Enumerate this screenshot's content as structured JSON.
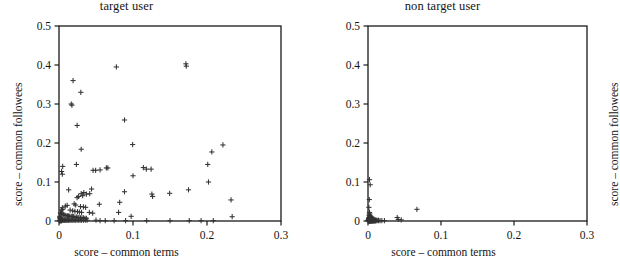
{
  "figure": {
    "background": "#ffffff",
    "marker_color": "#333333",
    "axis_color": "#1a1a1a"
  },
  "panels": [
    {
      "id": "target-user",
      "title": "target user",
      "xlabel": "score – common terms",
      "ylabel": "score – common followees"
    },
    {
      "id": "non-target-user",
      "title": "non target user",
      "xlabel": "score – common terms",
      "ylabel": "score – common followees"
    }
  ],
  "chart_data": [
    {
      "type": "scatter",
      "title": "target user",
      "xlabel": "score – common terms",
      "ylabel": "score – common followees",
      "xlim": [
        0,
        0.3
      ],
      "ylim": [
        0,
        0.5
      ],
      "xticks": [
        0,
        0.1,
        0.2,
        0.3
      ],
      "xtick_labels": [
        "0",
        "0.1",
        "0.2",
        "0.3"
      ],
      "yticks": [
        0,
        0.1,
        0.2,
        0.3,
        0.4,
        0.5
      ],
      "ytick_labels": [
        "0",
        "0.1",
        "0.2",
        "0.3",
        "0.4",
        "0.5"
      ],
      "grid": false,
      "legend": null,
      "marker": "plus",
      "points": [
        [
          0.0775,
          0.395
        ],
        [
          0.1715,
          0.403
        ],
        [
          0.172,
          0.397
        ],
        [
          0.019,
          0.36
        ],
        [
          0.0295,
          0.33
        ],
        [
          0.0165,
          0.3
        ],
        [
          0.0175,
          0.297
        ],
        [
          0.0245,
          0.245
        ],
        [
          0.0885,
          0.259
        ],
        [
          0.0995,
          0.196
        ],
        [
          0.03,
          0.184
        ],
        [
          0.2215,
          0.195
        ],
        [
          0.2065,
          0.177
        ],
        [
          0.201,
          0.145
        ],
        [
          0.0235,
          0.145
        ],
        [
          0.005,
          0.14
        ],
        [
          0.0035,
          0.127
        ],
        [
          0.0045,
          0.12
        ],
        [
          0.046,
          0.13
        ],
        [
          0.0495,
          0.13
        ],
        [
          0.0555,
          0.131
        ],
        [
          0.064,
          0.136
        ],
        [
          0.066,
          0.136
        ],
        [
          0.114,
          0.137
        ],
        [
          0.118,
          0.133
        ],
        [
          0.1245,
          0.133
        ],
        [
          0.1,
          0.116
        ],
        [
          0.202,
          0.1
        ],
        [
          0.175,
          0.08
        ],
        [
          0.013,
          0.08
        ],
        [
          0.0885,
          0.075
        ],
        [
          0.1255,
          0.069
        ],
        [
          0.1265,
          0.063
        ],
        [
          0.1495,
          0.071
        ],
        [
          0.044,
          0.082
        ],
        [
          0.0335,
          0.073
        ],
        [
          0.03,
          0.07
        ],
        [
          0.032,
          0.065
        ],
        [
          0.037,
          0.069
        ],
        [
          0.0415,
          0.07
        ],
        [
          0.0265,
          0.063
        ],
        [
          0.0245,
          0.06
        ],
        [
          0.2325,
          0.054
        ],
        [
          0.082,
          0.048
        ],
        [
          0.0545,
          0.043
        ],
        [
          0.0205,
          0.044
        ],
        [
          0.0225,
          0.041
        ],
        [
          0.011,
          0.04
        ],
        [
          0.0085,
          0.038
        ],
        [
          0.029,
          0.037
        ],
        [
          0.033,
          0.036
        ],
        [
          0.036,
          0.035
        ],
        [
          0.0045,
          0.034
        ],
        [
          0.005,
          0.03
        ],
        [
          0.0035,
          0.028
        ],
        [
          0.015,
          0.028
        ],
        [
          0.0185,
          0.026
        ],
        [
          0.0215,
          0.025
        ],
        [
          0.025,
          0.024
        ],
        [
          0.0275,
          0.023
        ],
        [
          0.0305,
          0.022
        ],
        [
          0.041,
          0.022
        ],
        [
          0.0455,
          0.02
        ],
        [
          0.0805,
          0.022
        ],
        [
          0.0975,
          0.012
        ],
        [
          0.234,
          0.011
        ],
        [
          0.002,
          0.021
        ],
        [
          0.003,
          0.019
        ],
        [
          0.004,
          0.018
        ],
        [
          0.0055,
          0.017
        ],
        [
          0.0065,
          0.016
        ],
        [
          0.008,
          0.015
        ],
        [
          0.0095,
          0.014
        ],
        [
          0.0115,
          0.013
        ],
        [
          0.013,
          0.013
        ],
        [
          0.0145,
          0.012
        ],
        [
          0.0165,
          0.012
        ],
        [
          0.018,
          0.011
        ],
        [
          0.0195,
          0.011
        ],
        [
          0.0215,
          0.01
        ],
        [
          0.0235,
          0.01
        ],
        [
          0.0255,
          0.009
        ],
        [
          0.027,
          0.009
        ],
        [
          0.029,
          0.008
        ],
        [
          0.031,
          0.008
        ],
        [
          0.033,
          0.008
        ],
        [
          0.035,
          0.007
        ],
        [
          0.037,
          0.007
        ],
        [
          0.001,
          0.012
        ],
        [
          0.0012,
          0.009
        ],
        [
          0.0015,
          0.007
        ],
        [
          0.0018,
          0.006
        ],
        [
          0.0022,
          0.005
        ],
        [
          0.0026,
          0.004
        ],
        [
          0.003,
          0.004
        ],
        [
          0.0035,
          0.003
        ],
        [
          0.004,
          0.003
        ],
        [
          0.0048,
          0.003
        ],
        [
          0.0056,
          0.002
        ],
        [
          0.0065,
          0.002
        ],
        [
          0.0075,
          0.002
        ],
        [
          0.0085,
          0.002
        ],
        [
          0.0095,
          0.002
        ],
        [
          0.0105,
          0.002
        ],
        [
          0.0118,
          0.002
        ],
        [
          0.013,
          0.002
        ],
        [
          0.0145,
          0.002
        ],
        [
          0.016,
          0.002
        ],
        [
          0.0175,
          0.002
        ],
        [
          0.019,
          0.002
        ],
        [
          0.0205,
          0.002
        ],
        [
          0.0225,
          0.002
        ],
        [
          0.0245,
          0.002
        ],
        [
          0.0265,
          0.002
        ],
        [
          0.0285,
          0.002
        ],
        [
          0.0305,
          0.002
        ],
        [
          0.033,
          0.002
        ],
        [
          0.0355,
          0.002
        ],
        [
          0.038,
          0.002
        ],
        [
          0.0005,
          0.002
        ],
        [
          0.0008,
          0.001
        ],
        [
          0.0012,
          0.001
        ],
        [
          0.0016,
          0.001
        ],
        [
          0.002,
          0.001
        ],
        [
          0.0025,
          0.001
        ],
        [
          0.003,
          0.001
        ],
        [
          0.0036,
          0.001
        ],
        [
          0.05,
          0.002
        ],
        [
          0.0555,
          0.001
        ],
        [
          0.0625,
          0.001
        ],
        [
          0.0745,
          0.001
        ],
        [
          0.09,
          0.001
        ],
        [
          0.1185,
          0.001
        ],
        [
          0.15,
          0.001
        ],
        [
          0.176,
          0.001
        ],
        [
          0.192,
          0.001
        ],
        [
          0.2085,
          0.001
        ]
      ]
    },
    {
      "type": "scatter",
      "title": "non target user",
      "xlabel": "score – common terms",
      "ylabel": "score – common followees",
      "xlim": [
        0,
        0.3
      ],
      "ylim": [
        0,
        0.5
      ],
      "xticks": [
        0,
        0.1,
        0.2,
        0.3
      ],
      "xtick_labels": [
        "0",
        "0.1",
        "0.2",
        "0.3"
      ],
      "yticks": [
        0,
        0.1,
        0.2,
        0.3,
        0.4,
        0.5
      ],
      "ytick_labels": [
        "0",
        "0.1",
        "0.2",
        "0.3",
        "0.4",
        "0.5"
      ],
      "grid": false,
      "legend": null,
      "marker": "plus",
      "points": [
        [
          0.003,
          0.093
        ],
        [
          0.002,
          0.106
        ],
        [
          0.0018,
          0.055
        ],
        [
          0.0012,
          0.035
        ],
        [
          0.067,
          0.03
        ],
        [
          0.04,
          0.009
        ],
        [
          0.0415,
          0.004
        ],
        [
          0.0455,
          0.003
        ],
        [
          0.002,
          0.022
        ],
        [
          0.0025,
          0.018
        ],
        [
          0.0015,
          0.015
        ],
        [
          0.003,
          0.013
        ],
        [
          0.004,
          0.012
        ],
        [
          0.0022,
          0.011
        ],
        [
          0.0035,
          0.01
        ],
        [
          0.0045,
          0.009
        ],
        [
          0.0012,
          0.009
        ],
        [
          0.0028,
          0.008
        ],
        [
          0.005,
          0.008
        ],
        [
          0.0018,
          0.007
        ],
        [
          0.0038,
          0.007
        ],
        [
          0.006,
          0.006
        ],
        [
          0.0008,
          0.006
        ],
        [
          0.0025,
          0.006
        ],
        [
          0.0044,
          0.005
        ],
        [
          0.007,
          0.005
        ],
        [
          0.0014,
          0.005
        ],
        [
          0.0032,
          0.004
        ],
        [
          0.0052,
          0.004
        ],
        [
          0.008,
          0.004
        ],
        [
          0.0006,
          0.004
        ],
        [
          0.002,
          0.003
        ],
        [
          0.0036,
          0.003
        ],
        [
          0.0058,
          0.003
        ],
        [
          0.009,
          0.003
        ],
        [
          0.001,
          0.003
        ],
        [
          0.0026,
          0.002
        ],
        [
          0.0042,
          0.002
        ],
        [
          0.0064,
          0.002
        ],
        [
          0.01,
          0.002
        ],
        [
          0.0004,
          0.002
        ],
        [
          0.0016,
          0.002
        ],
        [
          0.003,
          0.002
        ],
        [
          0.0048,
          0.002
        ],
        [
          0.0072,
          0.002
        ],
        [
          0.0112,
          0.002
        ],
        [
          0.014,
          0.002
        ],
        [
          0.0003,
          0.001
        ],
        [
          0.0008,
          0.001
        ],
        [
          0.0013,
          0.001
        ],
        [
          0.0019,
          0.001
        ],
        [
          0.0024,
          0.001
        ],
        [
          0.003,
          0.001
        ],
        [
          0.0037,
          0.001
        ],
        [
          0.0044,
          0.001
        ],
        [
          0.0052,
          0.001
        ],
        [
          0.006,
          0.001
        ],
        [
          0.007,
          0.001
        ],
        [
          0.0082,
          0.001
        ],
        [
          0.0096,
          0.001
        ],
        [
          0.011,
          0.001
        ],
        [
          0.0125,
          0.001
        ],
        [
          0.0145,
          0.001
        ],
        [
          0.0165,
          0.001
        ],
        [
          0.019,
          0.001
        ],
        [
          0.0225,
          0.001
        ],
        [
          0.0002,
          0.0005
        ],
        [
          0.0006,
          0.0005
        ],
        [
          0.0011,
          0.0005
        ],
        [
          0.0016,
          0.0005
        ],
        [
          0.0021,
          0.0005
        ],
        [
          0.0027,
          0.0005
        ],
        [
          0.0033,
          0.0005
        ],
        [
          0.004,
          0.0005
        ],
        [
          0.0047,
          0.0005
        ],
        [
          0.0055,
          0.0005
        ],
        [
          0.0064,
          0.0005
        ],
        [
          0.0074,
          0.0005
        ],
        [
          0.0086,
          0.0005
        ],
        [
          0.01,
          0.0005
        ]
      ]
    }
  ]
}
